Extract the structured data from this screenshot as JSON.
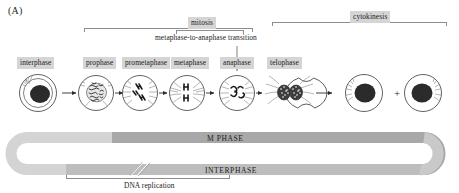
{
  "figure": {
    "panel_letter": "(A)",
    "type": "cell-cycle-diagram"
  },
  "brackets": {
    "mitosis": {
      "label": "mitosis"
    },
    "cytokinesis": {
      "label": "cytokinesis"
    },
    "metaphase_to_anaphase": {
      "label": "metaphase-to-anaphase transition"
    },
    "dna_replication": {
      "label": "DNA replication"
    }
  },
  "stages": [
    {
      "label": "interphase",
      "name": "stage-interphase"
    },
    {
      "label": "prophase",
      "name": "stage-prophase"
    },
    {
      "label": "prometaphase",
      "name": "stage-prometaphase"
    },
    {
      "label": "metaphase",
      "name": "stage-metaphase"
    },
    {
      "label": "anaphase",
      "name": "stage-anaphase"
    },
    {
      "label": "telophase",
      "name": "stage-telophase"
    }
  ],
  "phase_bars": {
    "m_phase": {
      "label": "M PHASE",
      "color": "#a8a8a8"
    },
    "interphase": {
      "label": "INTERPHASE",
      "color": "#bdbdbd"
    },
    "loop_color": "#d4d4d4"
  },
  "colors": {
    "chip_bg": "#d5d5d5",
    "line": "#8d8d8d",
    "ink": "#231f20",
    "nucleus": "#2b2b2b"
  },
  "icons": {
    "arrow_right": "arrow-right-icon",
    "arrow_down": "arrow-down-icon",
    "plus": "plus-icon",
    "break_mark": "break-mark-icon"
  }
}
